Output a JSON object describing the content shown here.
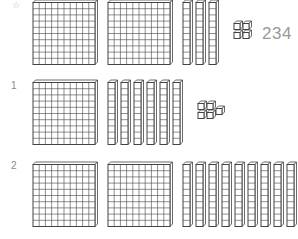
{
  "example": {
    "marker_icon": "star-icon",
    "marker_glyph": "☆",
    "hundreds": 2,
    "tens": 3,
    "ones": 4,
    "answer": "234"
  },
  "problems": [
    {
      "number": "1",
      "hundreds": 1,
      "tens": 6,
      "ones": 5
    },
    {
      "number": "2",
      "hundreds": 2,
      "tens": 9,
      "ones": 0
    }
  ],
  "colors": {
    "stroke": "#444444",
    "label": "#888888",
    "answer": "#999999"
  }
}
